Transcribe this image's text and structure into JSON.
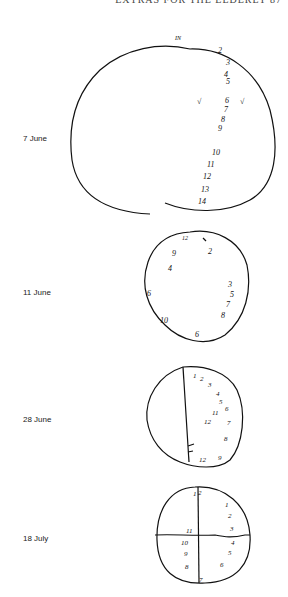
{
  "header": {
    "running_head": "EXTRAS FOR THE ELDERLY   87"
  },
  "clocks": [
    {
      "date": "7 June",
      "numbers": [
        "IN",
        "2",
        "3",
        "4",
        "5",
        "6",
        "7",
        "8",
        "9",
        "10",
        "11",
        "12",
        "13",
        "14"
      ],
      "marks": [
        "√",
        "√"
      ]
    },
    {
      "date": "11 June",
      "numbers": [
        "12",
        "2",
        "9",
        "4",
        "6",
        "3",
        "5",
        "7",
        "8",
        "10",
        "6"
      ]
    },
    {
      "date": "28 June",
      "numbers": [
        "1",
        "2",
        "3",
        "4",
        "5",
        "6",
        "11",
        "12",
        "7",
        "8",
        "12",
        "9"
      ]
    },
    {
      "date": "18 July",
      "numbers": [
        "1",
        "2",
        "1",
        "2",
        "3",
        "11",
        "4",
        "10",
        "5",
        "9",
        "6",
        "8",
        "7"
      ]
    }
  ]
}
